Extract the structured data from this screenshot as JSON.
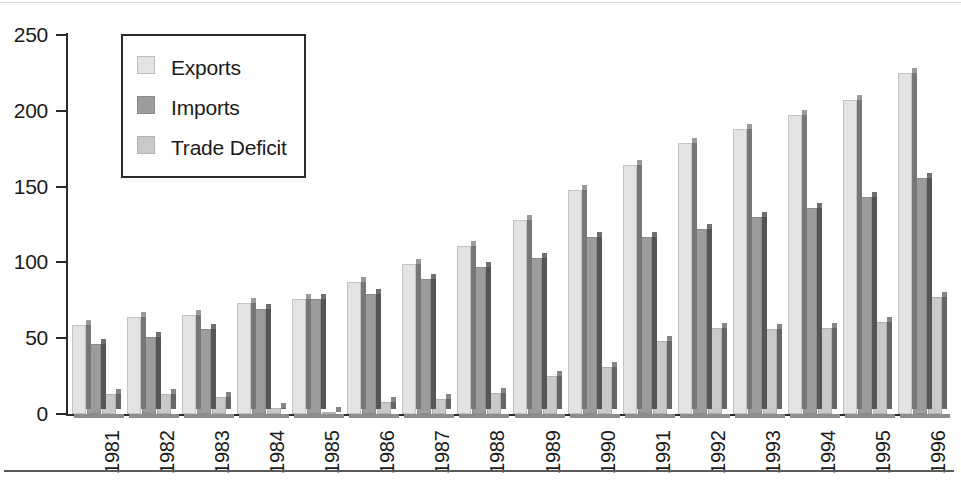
{
  "chart_data": {
    "type": "bar",
    "title": "",
    "xlabel": "",
    "ylabel": "",
    "ylim": [
      0,
      250
    ],
    "yticks": [
      0,
      50,
      100,
      150,
      200,
      250
    ],
    "ytick_labels": [
      "0",
      "50",
      "100",
      "150",
      "200",
      "250"
    ],
    "grid": false,
    "legend_position": "upper-left-inset",
    "categories": [
      "1981",
      "1982",
      "1983",
      "1984",
      "1985",
      "1986",
      "1987",
      "1988",
      "1989",
      "1990",
      "1991",
      "1992",
      "1993",
      "1994",
      "1995",
      "1996"
    ],
    "series": [
      {
        "name": "Exports",
        "color": "#e3e3e3",
        "values": [
          59,
          64,
          65,
          73,
          76,
          87,
          99,
          111,
          128,
          148,
          164,
          179,
          188,
          197,
          207,
          225
        ]
      },
      {
        "name": "Imports",
        "color": "#9c9c9c",
        "values": [
          46,
          51,
          56,
          69,
          76,
          79,
          89,
          97,
          103,
          117,
          117,
          122,
          130,
          136,
          143,
          156
        ]
      },
      {
        "name": "Trade Deficit",
        "color": "#c9c9c9",
        "values": [
          13,
          13,
          11,
          4,
          1,
          8,
          10,
          14,
          25,
          31,
          48,
          57,
          56,
          57,
          61,
          77
        ]
      }
    ]
  },
  "legend": {
    "items": [
      {
        "label": "Exports"
      },
      {
        "label": "Imports"
      },
      {
        "label": "Trade Deficit"
      }
    ]
  }
}
